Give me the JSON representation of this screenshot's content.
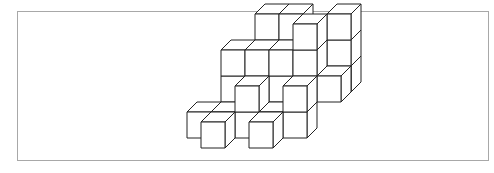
{
  "figure": {
    "stroke_color": "#222222",
    "face_color": "#ffffff",
    "frame_color": "#a8a8a8",
    "unit": {
      "w": 24,
      "h": 26,
      "dx": 10,
      "dy": -10
    },
    "origin": {
      "x": 187,
      "y": 138
    },
    "cubes": [
      {
        "x": 2,
        "y": 2,
        "z": 3
      },
      {
        "x": 3,
        "y": 2,
        "z": 3
      },
      {
        "x": 5,
        "y": 2,
        "z": 3
      },
      {
        "x": 5,
        "y": 2,
        "z": 2
      },
      {
        "x": 5,
        "y": 2,
        "z": 1
      },
      {
        "x": 4,
        "y": 1,
        "z": 3
      },
      {
        "x": 1,
        "y": 1,
        "z": 2
      },
      {
        "x": 2,
        "y": 1,
        "z": 2
      },
      {
        "x": 4,
        "y": 1,
        "z": 2
      },
      {
        "x": 1,
        "y": 1,
        "z": 1
      },
      {
        "x": 2,
        "y": 1,
        "z": 1
      },
      {
        "x": 3,
        "y": 1,
        "z": 1
      },
      {
        "x": 4,
        "y": 1,
        "z": 1
      },
      {
        "x": 5,
        "y": 1,
        "z": 1
      },
      {
        "x": 3,
        "y": 1,
        "z": 2
      },
      {
        "x": 2,
        "y": 0,
        "z": 1
      },
      {
        "x": 4,
        "y": 0,
        "z": 1
      },
      {
        "x": 0,
        "y": 0,
        "z": 0
      },
      {
        "x": 1,
        "y": 0,
        "z": 0
      },
      {
        "x": 2,
        "y": 0,
        "z": 0
      },
      {
        "x": 3,
        "y": 0,
        "z": 0
      },
      {
        "x": 4,
        "y": 0,
        "z": 0
      },
      {
        "x": 1,
        "y": -1,
        "z": 0
      },
      {
        "x": 3,
        "y": -1,
        "z": 0
      }
    ]
  }
}
